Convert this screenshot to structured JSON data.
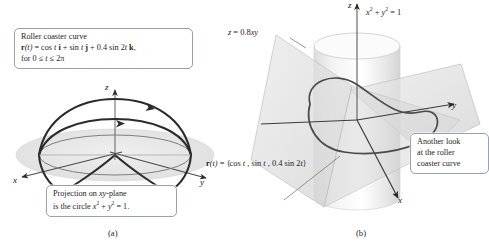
{
  "figure": {
    "panel_a": {
      "caption": "(a)",
      "callout_top": {
        "line1": "Roller coaster curve",
        "line2_prefix": "r",
        "line2_arg": "(t)",
        "line2_body": " = cos t i + sin t j + 0.4 sin 2t k,",
        "line3": "for 0 ≤ t ≤ 2π"
      },
      "callout_bottom": {
        "line1": "Projection on xy-plane",
        "line2": "is the circle x² + y² = 1."
      },
      "axes": {
        "x": "x",
        "y": "y",
        "z": "z"
      }
    },
    "panel_b": {
      "caption": "(b)",
      "surface_label": "z = 0.8xy",
      "cylinder_label": "x² + y² = 1",
      "curve_label": "r(t) = ⟨cos t, sin t, 0.4 sin 2t⟩",
      "callout": {
        "line1": "Another look",
        "line2": "at the roller",
        "line3": "coaster curve"
      },
      "axes": {
        "x": "x",
        "y": "y",
        "z": "z"
      }
    }
  },
  "colors": {
    "curve": "#2b2b2b",
    "axis": "#3b3b3b",
    "plane_fill": "#e3e3e3",
    "surface_fill": "#d9d9d9",
    "cylinder_fill": "#ededed",
    "callout_border": "#9aa0ad",
    "background": "#ffffff"
  }
}
